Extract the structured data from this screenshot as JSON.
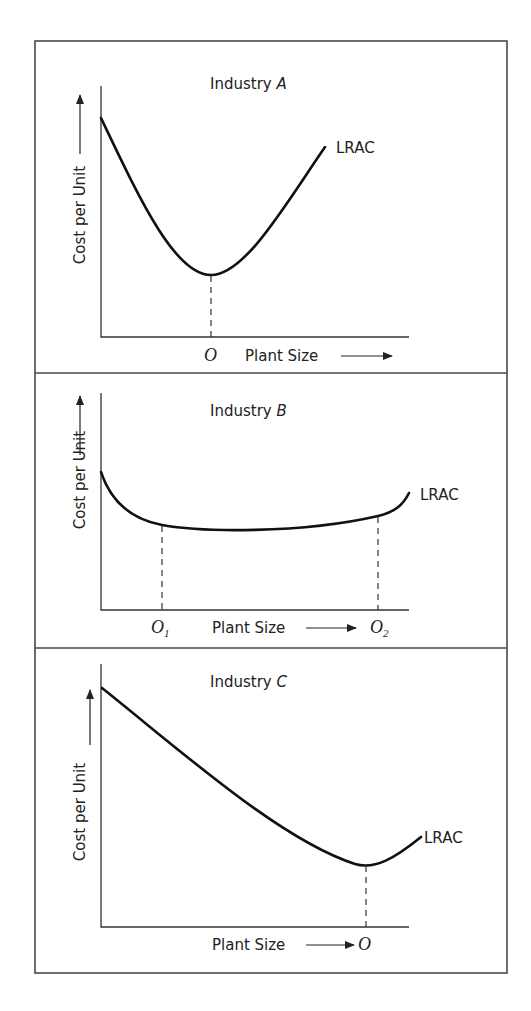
{
  "figure": {
    "frame": {
      "x": 35,
      "y": 41,
      "width": 472,
      "height": 932
    },
    "dividers_y": [
      373,
      648
    ],
    "y_axis_label": "Cost per Unit",
    "x_axis_label": "Plant Size",
    "curve_label": "LRAC",
    "panels": [
      {
        "id": "A",
        "title_prefix": "Industry ",
        "title_letter": "A",
        "axis": {
          "x0": 101,
          "y_top": 86,
          "y0": 337,
          "x_end": 409
        },
        "curve_path": "M101,118 C140,200 175,275 211,275 C245,275 285,205 325,147",
        "curve_label_pos": [
          336,
          153
        ],
        "markers": [
          {
            "label": "O",
            "subscript": "",
            "x": 211,
            "y_from": 276,
            "label_x": 204,
            "label_y": 361
          }
        ],
        "x_label_pos": [
          245,
          361
        ],
        "x_arrow": {
          "x1": 341,
          "x2": 392,
          "y": 356
        },
        "y_label_center": [
          80,
          215
        ],
        "y_arrow": {
          "x": 80,
          "y_top": 95,
          "y_bottom": 154
        }
      },
      {
        "id": "B",
        "title_prefix": "Industry ",
        "title_letter": "B",
        "axis": {
          "x0": 101,
          "y_top": 393,
          "y0": 610,
          "x_end": 409
        },
        "curve_path": "M101,472 C112,505 135,520 162,525 C200,532 300,534 378,516 C395,512 403,505 409,493",
        "curve_label_pos": [
          420,
          500
        ],
        "markers": [
          {
            "label": "O",
            "subscript": "1",
            "x": 162,
            "y_from": 526,
            "label_x": 151,
            "label_y": 633
          },
          {
            "label": "O",
            "subscript": "2",
            "x": 378,
            "y_from": 517,
            "label_x": 370,
            "label_y": 633
          }
        ],
        "x_label_pos": [
          212,
          633
        ],
        "x_arrow": {
          "x1": 306,
          "x2": 356,
          "y": 628
        },
        "y_label_center": [
          80,
          480
        ],
        "y_arrow": {
          "x": 80,
          "y_top": 396,
          "y_bottom": 455
        }
      },
      {
        "id": "C",
        "title_prefix": "Industry ",
        "title_letter": "C",
        "axis": {
          "x0": 101,
          "y_top": 664,
          "y0": 927,
          "x_end": 409
        },
        "curve_path": "M102,688 C180,750 280,840 355,864 C375,870 395,858 421,837",
        "curve_label_pos": [
          424,
          843
        ],
        "markers": [
          {
            "label": "O",
            "subscript": "",
            "x": 366,
            "y_from": 866,
            "label_x": 358,
            "label_y": 950
          }
        ],
        "x_label_pos": [
          212,
          950
        ],
        "x_arrow": {
          "x1": 306,
          "x2": 354,
          "y": 945
        },
        "y_label_center": [
          80,
          812
        ],
        "y_arrow": {
          "x": 90,
          "y_top": 690,
          "y_bottom": 745
        }
      }
    ]
  }
}
